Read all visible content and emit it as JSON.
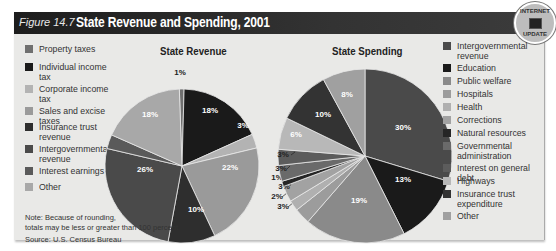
{
  "figure": {
    "number": "Figure 14.7",
    "title": "State Revenue and Spending, 2001",
    "badge": {
      "top": "INTERNET",
      "bottom": "UPDATE",
      "icon": "computer-monitor-icon"
    }
  },
  "note": {
    "line1": "Note: Because of rounding,",
    "line2": "totals may be less or greater than 100 percent.",
    "source": "Source: U.S. Census Bureau"
  },
  "revenue_legend": [
    {
      "label": "Property taxes",
      "color": "#6f6f6f"
    },
    {
      "label": "Individual income tax",
      "color": "#1a1a1a"
    },
    {
      "label": "Corporate income tax",
      "color": "#b3b3b3"
    },
    {
      "label": "Sales and excise taxes",
      "color": "#9a9a9a"
    },
    {
      "label": "Insurance trust revenue",
      "color": "#2e2e2e"
    },
    {
      "label": "Intergovernmental revenue",
      "color": "#4a4a4a"
    },
    {
      "label": "Interest earnings",
      "color": "#5a5a5a"
    },
    {
      "label": "Other",
      "color": "#a8a8a8"
    }
  ],
  "spending_legend": [
    {
      "label": "Intergovernmental revenue",
      "color": "#4a4a4a"
    },
    {
      "label": "Education",
      "color": "#1a1a1a"
    },
    {
      "label": "Public welfare",
      "color": "#8a8a8a"
    },
    {
      "label": "Hospitals",
      "color": "#9c9c9c"
    },
    {
      "label": "Health",
      "color": "#b0b0b0"
    },
    {
      "label": "Corrections",
      "color": "#a2a2a2"
    },
    {
      "label": "Natural resources",
      "color": "#262626"
    },
    {
      "label": "Governmental administration",
      "color": "#6a6a6a"
    },
    {
      "label": "Interest on general debt",
      "color": "#5c5c5c"
    },
    {
      "label": "Highways",
      "color": "#b8b8b8"
    },
    {
      "label": "Insurance trust expenditure",
      "color": "#333333"
    },
    {
      "label": "Other",
      "color": "#a0a0a0"
    }
  ],
  "chart_data": [
    {
      "type": "pie",
      "title": "State Revenue",
      "categories": [
        "Property taxes",
        "Individual income tax",
        "Corporate income tax",
        "Sales and excise taxes",
        "Insurance trust revenue",
        "Intergovernmental revenue",
        "Interest earnings",
        "Other"
      ],
      "values": [
        1,
        18,
        3,
        22,
        10,
        26,
        3,
        18
      ],
      "labels": [
        "1%",
        "18%",
        "3%",
        "22%",
        "10%",
        "26%",
        "3%",
        "18%"
      ],
      "unit": "percent"
    },
    {
      "type": "pie",
      "title": "State Spending",
      "categories": [
        "Intergovernmental revenue",
        "Education",
        "Public welfare",
        "Hospitals",
        "Health",
        "Corrections",
        "Natural resources",
        "Governmental administration",
        "Interest on general debt",
        "Highways",
        "Insurance trust expenditure",
        "Other"
      ],
      "values": [
        30,
        13,
        19,
        3,
        2,
        3,
        1,
        3,
        3,
        6,
        10,
        8
      ],
      "labels": [
        "30%",
        "13%",
        "19%",
        "3%",
        "2%",
        "3%",
        "1%",
        "3%",
        "3%",
        "6%",
        "10%",
        "8%"
      ],
      "unit": "percent"
    }
  ]
}
